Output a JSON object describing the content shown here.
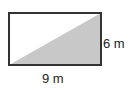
{
  "diagram": {
    "shape": "rectangle",
    "height_label": "6 m",
    "width_label": "9 m",
    "dimensions": {
      "width": 9,
      "height": 6,
      "unit": "m"
    },
    "shaded_region": "triangle",
    "shaded_vertices": [
      "bottom-left",
      "bottom-right",
      "top-right"
    ],
    "shade_color": "#c8c8c8",
    "outline_color": "#333333"
  }
}
